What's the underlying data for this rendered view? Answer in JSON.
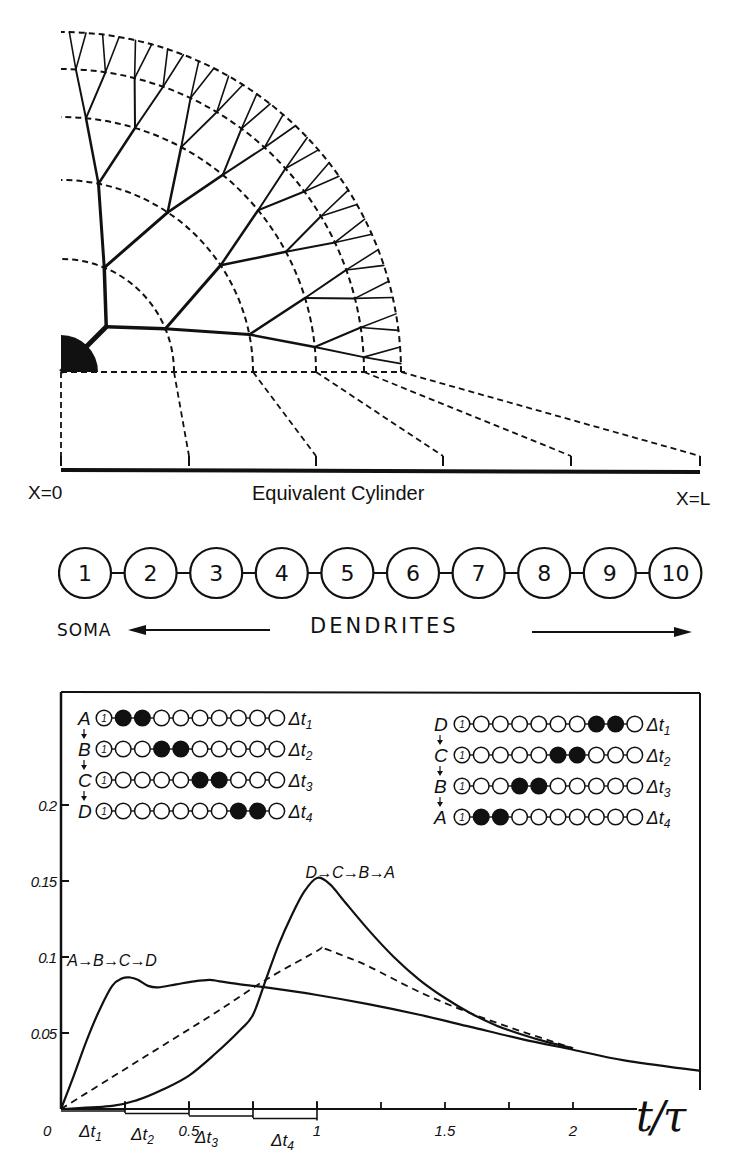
{
  "tree_diagram": {
    "soma_center": [
      61,
      372
    ],
    "soma_radius": 37,
    "shell_radii": [
      113,
      192,
      255,
      303,
      340
    ],
    "node_radii": [
      64,
      113,
      192,
      255,
      303,
      340
    ],
    "levels": 6,
    "cylinder": {
      "y": 470,
      "x_start": 61,
      "x_end": 700,
      "label_left": "X=0",
      "label_center": "Equivalent Cylinder",
      "label_right": "X=L",
      "tick_x": [
        61,
        189,
        316,
        443,
        571,
        700
      ]
    }
  },
  "compartments": {
    "labels": [
      "1",
      "2",
      "3",
      "4",
      "5",
      "6",
      "7",
      "8",
      "9",
      "10"
    ],
    "soma_label": "SOMA",
    "dendrites_label": "DENDRITES"
  },
  "insets": {
    "left": {
      "rows": [
        {
          "letter": "A",
          "filled": [
            2,
            3
          ],
          "dt": "Δt",
          "dt_sub": "1"
        },
        {
          "letter": "B",
          "filled": [
            4,
            5
          ],
          "dt": "Δt",
          "dt_sub": "2"
        },
        {
          "letter": "C",
          "filled": [
            6,
            7
          ],
          "dt": "Δt",
          "dt_sub": "3"
        },
        {
          "letter": "D",
          "filled": [
            8,
            9
          ],
          "dt": "Δt",
          "dt_sub": "4"
        }
      ]
    },
    "right": {
      "rows": [
        {
          "letter": "D",
          "filled": [
            8,
            9
          ],
          "dt": "Δt",
          "dt_sub": "1"
        },
        {
          "letter": "C",
          "filled": [
            6,
            7
          ],
          "dt": "Δt",
          "dt_sub": "2"
        },
        {
          "letter": "B",
          "filled": [
            4,
            5
          ],
          "dt": "Δt",
          "dt_sub": "3"
        },
        {
          "letter": "A",
          "filled": [
            2,
            3
          ],
          "dt": "Δt",
          "dt_sub": "4"
        }
      ]
    },
    "first_node_label": "1"
  },
  "chart_data": {
    "type": "line",
    "title": "",
    "xlabel": "t/τ",
    "ylabel": "",
    "xlim": [
      0,
      2.5
    ],
    "ylim": [
      0,
      0.25
    ],
    "x_ticks": [
      0.25,
      0.5,
      0.75,
      1,
      1.25,
      1.5,
      1.75,
      2
    ],
    "x_tick_labels": [
      {
        "x": 0,
        "label": "0"
      },
      {
        "x": 0.5,
        "label": "0.5"
      },
      {
        "x": 1,
        "label": "1"
      },
      {
        "x": 1.5,
        "label": "1.5"
      },
      {
        "x": 2,
        "label": "2"
      }
    ],
    "y_ticks": [
      0.05,
      0.1,
      0.15,
      0.2
    ],
    "y_tick_labels": [
      "0.05",
      "0.1",
      "0.15",
      "0.2"
    ],
    "interval_labels": [
      {
        "label": "Δt",
        "sub": "1",
        "from": 0,
        "to": 0.25
      },
      {
        "label": "Δt",
        "sub": "2",
        "from": 0.25,
        "to": 0.5
      },
      {
        "label": "Δt",
        "sub": "3",
        "from": 0.5,
        "to": 0.75
      },
      {
        "label": "Δt",
        "sub": "4",
        "from": 0.75,
        "to": 1.0
      }
    ],
    "grid": false,
    "series": [
      {
        "name": "A→B→C→D",
        "style": "solid",
        "label_pos": [
          0.22,
          0.094
        ],
        "x": [
          0,
          0.05,
          0.1,
          0.15,
          0.2,
          0.24,
          0.27,
          0.3,
          0.34,
          0.38,
          0.45,
          0.52,
          0.58,
          0.62,
          0.7,
          0.8,
          1.0,
          1.2,
          1.4,
          1.6,
          1.8,
          2.0,
          2.2,
          2.5
        ],
        "y": [
          0,
          0.022,
          0.045,
          0.065,
          0.081,
          0.086,
          0.0865,
          0.085,
          0.081,
          0.08,
          0.082,
          0.084,
          0.085,
          0.084,
          0.082,
          0.08,
          0.075,
          0.069,
          0.062,
          0.054,
          0.046,
          0.039,
          0.032,
          0.025
        ]
      },
      {
        "name": "D→C→B→A",
        "style": "solid",
        "label_pos": [
          1.15,
          0.152
        ],
        "x": [
          0,
          0.2,
          0.3,
          0.4,
          0.5,
          0.6,
          0.7,
          0.75,
          0.8,
          0.85,
          0.9,
          0.95,
          1.0,
          1.05,
          1.1,
          1.2,
          1.3,
          1.4,
          1.5,
          1.6,
          1.7,
          1.8,
          1.9,
          2.0
        ],
        "y": [
          0,
          0.002,
          0.006,
          0.013,
          0.022,
          0.036,
          0.052,
          0.062,
          0.085,
          0.108,
          0.127,
          0.143,
          0.152,
          0.148,
          0.138,
          0.118,
          0.1,
          0.085,
          0.073,
          0.063,
          0.055,
          0.049,
          0.044,
          0.04
        ]
      },
      {
        "name": "simultaneous (dashed)",
        "style": "dashed",
        "x": [
          0,
          0.2,
          0.4,
          0.6,
          0.8,
          1.0,
          1.02,
          1.1,
          1.2,
          1.4,
          1.6,
          1.8,
          2.0
        ],
        "y": [
          0,
          0.021,
          0.042,
          0.063,
          0.085,
          0.104,
          0.106,
          0.101,
          0.094,
          0.077,
          0.063,
          0.051,
          0.04
        ]
      }
    ]
  }
}
